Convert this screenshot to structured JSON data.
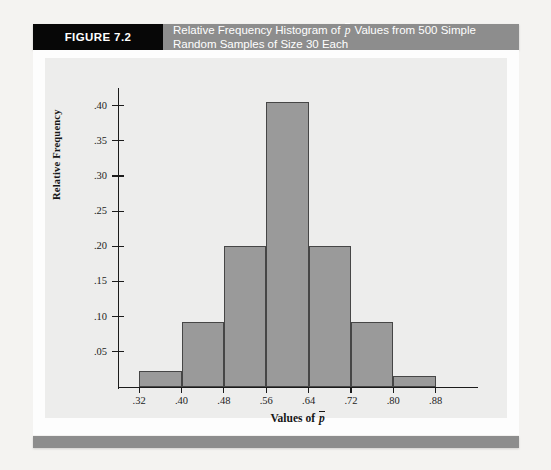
{
  "figure": {
    "tag": "FIGURE 7.2",
    "caption_line1_pre": "Relative Frequency Histogram of ",
    "caption_pbar": "p",
    "caption_line1_post": " Values from 500 Simple",
    "caption_line2": "Random Samples of Size 30 Each"
  },
  "colors": {
    "tag_background": "#070707",
    "banner_background": "#8d8d8d",
    "bar_fill": "#9a9a9a",
    "bar_stroke": "#464646",
    "plot_background": "#ededec",
    "page_background": "#f4f3f1",
    "axis": "#1b1b1b"
  },
  "chart_data": {
    "type": "bar",
    "xlabel": "Values of p̄",
    "ylabel": "Relative Frequency",
    "bin_edges": [
      0.32,
      0.4,
      0.48,
      0.56,
      0.64,
      0.72,
      0.8,
      0.88
    ],
    "categories": [
      "0.32-0.40",
      "0.40-0.48",
      "0.48-0.56",
      "0.56-0.64",
      "0.64-0.72",
      "0.72-0.80",
      "0.80-0.88"
    ],
    "values": [
      0.023,
      0.092,
      0.2,
      0.405,
      0.2,
      0.092,
      0.015
    ],
    "xtick_labels": [
      ".32",
      ".40",
      ".48",
      ".56",
      ".64",
      ".72",
      ".80",
      ".88"
    ],
    "xtick_values": [
      0.32,
      0.4,
      0.48,
      0.56,
      0.64,
      0.72,
      0.8,
      0.88
    ],
    "ytick_labels": [
      ".05",
      ".10",
      ".15",
      ".20",
      ".25",
      ".30",
      ".35",
      ".40"
    ],
    "ytick_values": [
      0.05,
      0.1,
      0.15,
      0.2,
      0.25,
      0.3,
      0.35,
      0.4
    ],
    "xlim": [
      0.28,
      0.96
    ],
    "ylim": [
      0,
      0.425
    ],
    "grid": false,
    "legend": null,
    "sample_count": 500,
    "sample_size": 30
  }
}
